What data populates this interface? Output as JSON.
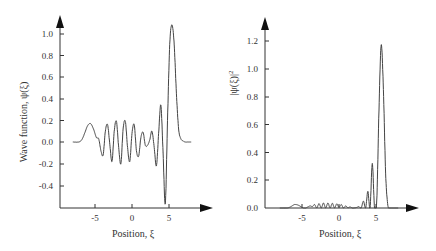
{
  "chart_data": [
    {
      "type": "line",
      "title": "",
      "xlabel": "Position, ξ",
      "ylabel": "Wave  function, ψ(ξ)",
      "xticks": [
        "-5",
        "0",
        "5"
      ],
      "yticks": [
        "-0.4",
        "-0.2",
        "0.0",
        "0.2",
        "0.4",
        "0.6",
        "0.8",
        "1.0"
      ],
      "xlim": [
        -8.8,
        10.8
      ],
      "ylim": [
        -0.6,
        1.2
      ],
      "grid": false,
      "series": [
        {
          "name": "psi",
          "x": [
            -8.0,
            -7.2,
            -6.8,
            -6.4,
            -6.0,
            -5.6,
            -5.2,
            -4.8,
            -4.5,
            -4.2,
            -3.9,
            -3.6,
            -3.3,
            -3.0,
            -2.7,
            -2.4,
            -2.1,
            -1.8,
            -1.5,
            -1.2,
            -0.9,
            -0.6,
            -0.3,
            0.0,
            0.3,
            0.6,
            0.9,
            1.2,
            1.5,
            1.8,
            2.1,
            2.4,
            2.7,
            3.0,
            3.3,
            3.6,
            3.9,
            4.2,
            4.5,
            4.8,
            5.1,
            5.4,
            5.7,
            6.0,
            6.3,
            6.6,
            6.9,
            7.2,
            7.6,
            8.0
          ],
          "y": [
            0.0,
            0.0,
            0.02,
            0.08,
            0.15,
            0.17,
            0.12,
            0.04,
            0.03,
            -0.08,
            -0.12,
            0.1,
            0.16,
            -0.02,
            -0.18,
            0.1,
            0.19,
            -0.05,
            -0.2,
            0.12,
            0.19,
            -0.05,
            -0.18,
            0.08,
            0.16,
            -0.08,
            -0.13,
            0.04,
            0.09,
            -0.03,
            -0.03,
            0.02,
            0.1,
            -0.05,
            -0.22,
            0.08,
            0.34,
            -0.1,
            -0.57,
            0.2,
            0.9,
            1.08,
            0.9,
            0.45,
            0.12,
            0.03,
            0.01,
            0.0,
            0.0,
            0.0
          ]
        }
      ]
    },
    {
      "type": "line",
      "title": "",
      "xlabel": "Position, ξ",
      "ylabel": "|ψ(ξ)|²",
      "xticks": [
        "-5",
        "0",
        "5"
      ],
      "yticks": [
        "0.0",
        "0.2",
        "0.4",
        "0.6",
        "0.8",
        "1.0",
        "1.2"
      ],
      "xlim": [
        -8.8,
        10.8
      ],
      "ylim": [
        0.0,
        1.35
      ],
      "grid": false,
      "series": [
        {
          "name": "probability density",
          "x": [
            -8.0,
            -7.0,
            -6.5,
            -6.0,
            -5.5,
            -5.0,
            -4.8,
            -4.5,
            -4.2,
            -3.9,
            -3.6,
            -3.3,
            -3.0,
            -2.7,
            -2.4,
            -2.1,
            -1.8,
            -1.5,
            -1.2,
            -0.9,
            -0.6,
            -0.3,
            0.0,
            0.3,
            0.6,
            0.9,
            1.2,
            1.5,
            1.8,
            2.1,
            2.4,
            2.7,
            3.0,
            3.3,
            3.6,
            3.9,
            4.2,
            4.5,
            4.8,
            5.1,
            5.4,
            5.7,
            6.0,
            6.3,
            6.6,
            6.9,
            7.2,
            7.6,
            8.0
          ],
          "y": [
            0.0,
            0.0,
            0.01,
            0.025,
            0.02,
            0.005,
            0.0,
            0.0,
            0.008,
            0.015,
            0.01,
            0.025,
            0.0,
            0.032,
            0.0,
            0.036,
            0.0,
            0.036,
            0.0,
            0.034,
            0.0,
            0.03,
            0.005,
            0.025,
            0.0,
            0.015,
            0.002,
            0.008,
            0.0,
            0.001,
            0.004,
            0.01,
            0.0,
            0.05,
            0.0,
            0.12,
            0.0,
            0.32,
            0.0,
            0.05,
            0.7,
            1.17,
            0.85,
            0.25,
            0.02,
            0.0,
            0.0,
            0.0,
            0.0
          ]
        }
      ]
    }
  ],
  "left_chart": {
    "ylabel": "Wave  function, ψ(ξ)",
    "xlabel": "Position, ξ",
    "yticks": [
      "1.0",
      "0.8",
      "0.6",
      "0.4",
      "0.2",
      "0.0",
      "-0.2",
      "-0.4"
    ],
    "xticks": [
      "-5",
      "0",
      "5"
    ]
  },
  "right_chart": {
    "ylabel": "|ψ(ξ)|",
    "ylabel_sup": "2",
    "xlabel": "Position, ξ",
    "yticks": [
      "1.2",
      "1.0",
      "0.8",
      "0.6",
      "0.4",
      "0.2",
      "0.0"
    ],
    "xticks": [
      "-5",
      "0",
      "5"
    ]
  }
}
